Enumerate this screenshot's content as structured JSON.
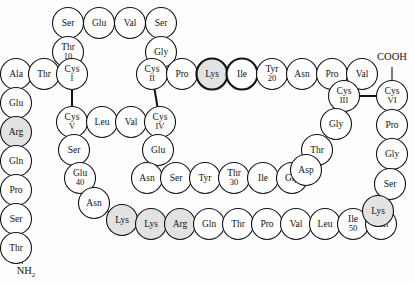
{
  "figure": {
    "geometry": {
      "width": 415,
      "height": 283,
      "circle_radius": 15.5,
      "stroke_normal": 1.1,
      "stroke_bold": 2.2
    },
    "colors": {
      "background": "#fdfdfd",
      "circle_fill_plain": "#ffffff",
      "circle_fill_shaded": "#e2e2e2",
      "stroke": "#141414",
      "text": "#111111",
      "bond": "#141414"
    },
    "termini": [
      {
        "name": "c-terminus",
        "label": "COOH",
        "x": 392,
        "y": 58,
        "connect_to": "cys6"
      },
      {
        "name": "n-terminus",
        "label": "NH",
        "subscript": "2",
        "x": 26,
        "y": 272,
        "connect_to": "thr-n1"
      }
    ],
    "residues": [
      {
        "id": "ser-top1",
        "label": "Ser",
        "number": "",
        "x": 68,
        "y": 23,
        "shaded": false,
        "bold": false
      },
      {
        "id": "glu-top",
        "label": "Glu",
        "number": "",
        "x": 99,
        "y": 23,
        "shaded": false,
        "bold": false
      },
      {
        "id": "val-top",
        "label": "Val",
        "number": "",
        "x": 130,
        "y": 23,
        "shaded": false,
        "bold": false
      },
      {
        "id": "ser-top2",
        "label": "Ser",
        "number": "",
        "x": 161,
        "y": 23,
        "shaded": false,
        "bold": false
      },
      {
        "id": "thr10",
        "label": "Thr",
        "number": "10",
        "x": 68,
        "y": 52,
        "shaded": false,
        "bold": false
      },
      {
        "id": "gly-up",
        "label": "Gly",
        "number": "",
        "x": 161,
        "y": 52,
        "shaded": false,
        "bold": false
      },
      {
        "id": "ala",
        "label": "Ala",
        "number": "",
        "x": 16,
        "y": 74,
        "shaded": false,
        "bold": false
      },
      {
        "id": "thr-left",
        "label": "Thr",
        "number": "",
        "x": 44,
        "y": 74,
        "shaded": false,
        "bold": false
      },
      {
        "id": "cys1",
        "label": "Cys",
        "number": "I",
        "x": 72,
        "y": 74,
        "shaded": false,
        "bold": false
      },
      {
        "id": "cys2",
        "label": "Cys",
        "number": "II",
        "x": 152,
        "y": 74,
        "shaded": false,
        "bold": false
      },
      {
        "id": "pro-top",
        "label": "Pro",
        "number": "",
        "x": 182,
        "y": 74,
        "shaded": false,
        "bold": false
      },
      {
        "id": "lys-bold",
        "label": "Lys",
        "number": "",
        "x": 212,
        "y": 74,
        "shaded": true,
        "bold": true
      },
      {
        "id": "ile-bold",
        "label": "Ile",
        "number": "",
        "x": 242,
        "y": 74,
        "shaded": false,
        "bold": true
      },
      {
        "id": "tyr20",
        "label": "Tyr",
        "number": "20",
        "x": 272,
        "y": 74,
        "shaded": false,
        "bold": false
      },
      {
        "id": "asn-top",
        "label": "Asn",
        "number": "",
        "x": 302,
        "y": 74,
        "shaded": false,
        "bold": false
      },
      {
        "id": "pro-top2",
        "label": "Pro",
        "number": "",
        "x": 332,
        "y": 74,
        "shaded": false,
        "bold": false
      },
      {
        "id": "val-top2",
        "label": "Val",
        "number": "",
        "x": 362,
        "y": 74,
        "shaded": false,
        "bold": false
      },
      {
        "id": "glu-left",
        "label": "Glu",
        "number": "",
        "x": 16,
        "y": 103,
        "shaded": false,
        "bold": false
      },
      {
        "id": "cys3",
        "label": "Cys",
        "number": "III",
        "x": 344,
        "y": 96,
        "shaded": false,
        "bold": false
      },
      {
        "id": "cys6",
        "label": "Cys",
        "number": "VI",
        "x": 392,
        "y": 96,
        "shaded": false,
        "bold": false
      },
      {
        "id": "arg-left",
        "label": "Arg",
        "number": "",
        "x": 16,
        "y": 132,
        "shaded": true,
        "bold": false
      },
      {
        "id": "cys5",
        "label": "Cys",
        "number": "V",
        "x": 72,
        "y": 122,
        "shaded": false,
        "bold": false
      },
      {
        "id": "leu-mid",
        "label": "Leu",
        "number": "",
        "x": 102,
        "y": 122,
        "shaded": false,
        "bold": false
      },
      {
        "id": "val-mid",
        "label": "Val",
        "number": "",
        "x": 131,
        "y": 122,
        "shaded": false,
        "bold": false
      },
      {
        "id": "cys4",
        "label": "Cys",
        "number": "IV",
        "x": 160,
        "y": 122,
        "shaded": false,
        "bold": false
      },
      {
        "id": "gly-r1",
        "label": "Gly",
        "number": "",
        "x": 336,
        "y": 124,
        "shaded": false,
        "bold": false
      },
      {
        "id": "pro-r1",
        "label": "Pro",
        "number": "",
        "x": 392,
        "y": 125,
        "shaded": false,
        "bold": false
      },
      {
        "id": "gln-left",
        "label": "Gln",
        "number": "",
        "x": 16,
        "y": 161,
        "shaded": false,
        "bold": false
      },
      {
        "id": "ser-c1",
        "label": "Ser",
        "number": "",
        "x": 74,
        "y": 150,
        "shaded": false,
        "bold": false
      },
      {
        "id": "glu-mid",
        "label": "Glu",
        "number": "",
        "x": 158,
        "y": 150,
        "shaded": false,
        "bold": false
      },
      {
        "id": "thr-r1",
        "label": "Thr",
        "number": "",
        "x": 317,
        "y": 150,
        "shaded": false,
        "bold": false
      },
      {
        "id": "gly-r2",
        "label": "Gly",
        "number": "",
        "x": 392,
        "y": 154,
        "shaded": false,
        "bold": false
      },
      {
        "id": "pro-left",
        "label": "Pro",
        "number": "",
        "x": 16,
        "y": 190,
        "shaded": false,
        "bold": false
      },
      {
        "id": "glu40",
        "label": "Glu",
        "number": "40",
        "x": 80,
        "y": 178,
        "shaded": false,
        "bold": false
      },
      {
        "id": "asn-m1",
        "label": "Asn",
        "number": "",
        "x": 147,
        "y": 178,
        "shaded": false,
        "bold": false
      },
      {
        "id": "ser-m1",
        "label": "Ser",
        "number": "",
        "x": 176,
        "y": 178,
        "shaded": false,
        "bold": false
      },
      {
        "id": "tyr-m1",
        "label": "Tyr",
        "number": "",
        "x": 205,
        "y": 178,
        "shaded": false,
        "bold": false
      },
      {
        "id": "thr30",
        "label": "Thr",
        "number": "30",
        "x": 234,
        "y": 178,
        "shaded": false,
        "bold": false
      },
      {
        "id": "ile-m1",
        "label": "Ile",
        "number": "",
        "x": 263,
        "y": 178,
        "shaded": false,
        "bold": false
      },
      {
        "id": "gly-m1",
        "label": "Gly",
        "number": "",
        "x": 292,
        "y": 178,
        "shaded": false,
        "bold": false
      },
      {
        "id": "asp-m1",
        "label": "Asp",
        "number": "",
        "x": 306,
        "y": 170,
        "shaded": false,
        "bold": false
      },
      {
        "id": "ser-r1",
        "label": "Ser",
        "number": "",
        "x": 390,
        "y": 184,
        "shaded": false,
        "bold": false
      },
      {
        "id": "ser-left",
        "label": "Ser",
        "number": "",
        "x": 16,
        "y": 219,
        "shaded": false,
        "bold": false
      },
      {
        "id": "asn-c1",
        "label": "Asn",
        "number": "",
        "x": 94,
        "y": 203,
        "shaded": false,
        "bold": false
      },
      {
        "id": "lys-b1",
        "label": "Lys",
        "number": "",
        "x": 122,
        "y": 220,
        "shaded": true,
        "bold": false
      },
      {
        "id": "lys-b2",
        "label": "Lys",
        "number": "",
        "x": 151,
        "y": 224,
        "shaded": true,
        "bold": false
      },
      {
        "id": "arg-b1",
        "label": "Arg",
        "number": "",
        "x": 180,
        "y": 224,
        "shaded": true,
        "bold": false
      },
      {
        "id": "gln-b1",
        "label": "Gln",
        "number": "",
        "x": 209,
        "y": 224,
        "shaded": false,
        "bold": false
      },
      {
        "id": "thr-b1",
        "label": "Thr",
        "number": "",
        "x": 238,
        "y": 224,
        "shaded": false,
        "bold": false
      },
      {
        "id": "pro-b1",
        "label": "Pro",
        "number": "",
        "x": 267,
        "y": 224,
        "shaded": false,
        "bold": false
      },
      {
        "id": "val-b1",
        "label": "Val",
        "number": "",
        "x": 296,
        "y": 224,
        "shaded": false,
        "bold": false
      },
      {
        "id": "leu-b1",
        "label": "Leu",
        "number": "",
        "x": 325,
        "y": 224,
        "shaded": false,
        "bold": false
      },
      {
        "id": "ile50",
        "label": "Ile",
        "number": "50",
        "x": 353,
        "y": 224,
        "shaded": false,
        "bold": false
      },
      {
        "id": "gln-b2",
        "label": "Gln",
        "number": "",
        "x": 381,
        "y": 224,
        "shaded": false,
        "bold": false
      },
      {
        "id": "lys-r1",
        "label": "Lys",
        "number": "",
        "x": 378,
        "y": 211,
        "shaded": true,
        "bold": false
      },
      {
        "id": "thr-n1",
        "label": "Thr",
        "number": "",
        "x": 16,
        "y": 248,
        "shaded": false,
        "bold": false
      }
    ],
    "chain_order": [
      "thr-n1",
      "ser-left",
      "pro-left",
      "gln-left",
      "arg-left",
      "glu-left",
      "ala",
      "thr-left",
      "cys1",
      "thr10",
      "ser-top1",
      "glu-top",
      "val-top",
      "ser-top2",
      "gly-up",
      "cys2",
      "pro-top",
      "lys-bold",
      "ile-bold",
      "tyr20",
      "asn-top",
      "pro-top2",
      "val-top2",
      "cys3",
      "gly-r1",
      "thr-r1",
      "asp-m1",
      "gly-m1",
      "ile-m1",
      "thr30",
      "tyr-m1",
      "ser-m1",
      "asn-m1",
      "glu-mid",
      "cys4",
      "val-mid",
      "leu-mid",
      "cys5",
      "ser-c1",
      "glu40",
      "asn-c1",
      "lys-b1",
      "lys-b2",
      "arg-b1",
      "gln-b1",
      "thr-b1",
      "pro-b1",
      "val-b1",
      "leu-b1",
      "ile50",
      "gln-b2",
      "lys-r1",
      "ser-r1",
      "gly-r2",
      "pro-r1",
      "cys6"
    ],
    "disulfide_bonds": [
      {
        "name": "bond-cys1-cys5",
        "from": "cys1",
        "to": "cys5"
      },
      {
        "name": "bond-cys2-cys4",
        "from": "cys2",
        "to": "cys4"
      },
      {
        "name": "bond-cys3-cys6",
        "from": "cys3",
        "to": "cys6"
      }
    ],
    "legend_note": ""
  }
}
